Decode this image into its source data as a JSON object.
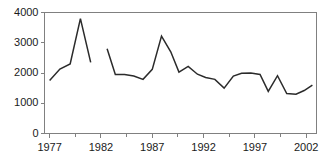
{
  "chart_data": {
    "type": "line",
    "title": "",
    "xlabel": "",
    "ylabel": "",
    "xlim": [
      1976.5,
      2003.0
    ],
    "ylim": [
      0,
      4000
    ],
    "grid": false,
    "legend_position": "none",
    "line_color": "#2b2b2b",
    "axis_color": "#808080",
    "background_color": "#ffffff",
    "ytick_labels": [
      "4000",
      "3000",
      "2000",
      "1000",
      "0"
    ],
    "ytick_values": [
      4000,
      3000,
      2000,
      1000,
      0
    ],
    "xtick_labels": [
      "1977",
      "1982",
      "1987",
      "1992",
      "1997",
      "2002"
    ],
    "xtick_values": [
      1977,
      1982,
      1987,
      1992,
      1997,
      2002
    ],
    "xminor_tick_values": [
      1979.5,
      1984.5,
      1989.5,
      1994.5,
      1999.5
    ],
    "series": [
      {
        "name": "series-1",
        "segments": [
          {
            "x": [
              1977,
              1978,
              1979,
              1980,
              1981
            ],
            "y": [
              1750,
              2130,
              2300,
              3800,
              2350
            ]
          },
          {
            "x": [
              1982.6,
              1983.4,
              1984.3,
              1985.2,
              1986.1,
              1987.0,
              1987.9,
              1988.8,
              1989.6,
              1990.5,
              1991.4,
              1992.2,
              1993.1,
              1994.0,
              1994.9,
              1995.7,
              1996.6,
              1997.5,
              1998.3,
              1999.2,
              2000.1,
              2001.0,
              2001.8,
              2002.6
            ],
            "y": [
              2800,
              1950,
              1950,
              1900,
              1790,
              2120,
              3220,
              2700,
              2030,
              2220,
              1960,
              1850,
              1790,
              1500,
              1900,
              1990,
              2000,
              1950,
              1390,
              1910,
              1320,
              1300,
              1420,
              1600
            ]
          }
        ]
      }
    ]
  }
}
